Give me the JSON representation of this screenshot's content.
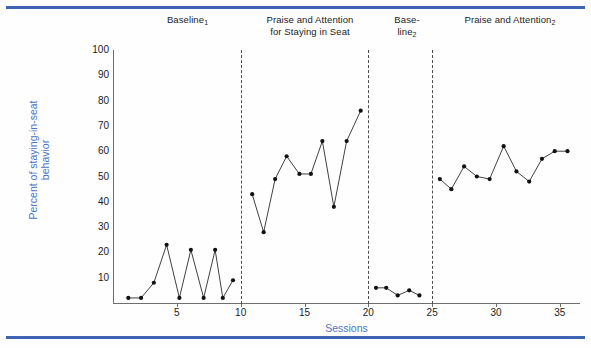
{
  "figure": {
    "top_rule_color": "#3f63b5",
    "bottom_rule_color": "#3f63b5",
    "axis_label_color": "#4a74c8"
  },
  "chart_data": {
    "type": "line",
    "title": "",
    "xlabel": "Sessions",
    "ylabel": "Percent of staying-in-seat behavior",
    "xlim": [
      0,
      36.5
    ],
    "ylim": [
      0,
      100
    ],
    "grid": false,
    "legend": "none",
    "ytick_labels": [
      "100",
      "90",
      "80",
      "70",
      "60",
      "50",
      "40",
      "30",
      "20",
      "10"
    ],
    "ytick_values": [
      100,
      90,
      80,
      70,
      60,
      50,
      40,
      30,
      20,
      10
    ],
    "xtick_labels": [
      "5",
      "10",
      "15",
      "20",
      "25",
      "30",
      "35"
    ],
    "xtick_values": [
      5,
      10,
      15,
      20,
      25,
      30,
      35
    ],
    "phase_dividers": [
      10,
      20,
      25
    ],
    "phases": [
      {
        "name": "Baseline 1",
        "label_lines": [
          "Baseline"
        ],
        "label_sub": "1",
        "x": [
          1.2,
          2.2,
          3.2,
          4.2,
          5.2,
          6.1,
          7.1,
          8.0,
          8.6,
          9.4
        ],
        "y": [
          2,
          2,
          8,
          23,
          2,
          21,
          2,
          21,
          2,
          9
        ]
      },
      {
        "name": "Praise and Attention for Staying in Seat",
        "label_lines": [
          "Praise and Attention",
          "for Staying in Seat"
        ],
        "label_sub": "",
        "x": [
          10.9,
          11.8,
          12.7,
          13.6,
          14.6,
          15.5,
          16.4,
          17.3,
          18.3,
          19.4
        ],
        "y": [
          43,
          28,
          49,
          58,
          51,
          51,
          64,
          38,
          64,
          76
        ]
      },
      {
        "name": "Baseline 2",
        "label_lines": [
          "Base-",
          "line"
        ],
        "label_sub": "2",
        "x": [
          20.6,
          21.4,
          22.3,
          23.2,
          24.0
        ],
        "y": [
          6,
          6,
          3,
          5,
          3
        ]
      },
      {
        "name": "Praise and Attention 2",
        "label_lines": [
          "Praise and Attention"
        ],
        "label_sub": "2",
        "x": [
          25.6,
          26.5,
          27.5,
          28.5,
          29.5,
          30.6,
          31.6,
          32.6,
          33.6,
          34.6,
          35.6
        ],
        "y": [
          49,
          45,
          54,
          50,
          49,
          62,
          52,
          48,
          57,
          60,
          60
        ]
      }
    ]
  },
  "phase_headers": {
    "p1_text": "Baseline",
    "p1_sub": "1",
    "p2_line1": "Praise and Attention",
    "p2_line2": "for Staying in Seat",
    "p3_line1": "Base-",
    "p3_line2": "line",
    "p3_sub": "2",
    "p4_text": "Praise and Attention",
    "p4_sub": "2"
  }
}
